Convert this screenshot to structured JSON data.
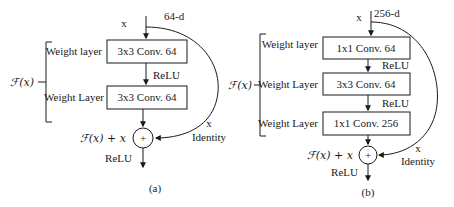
{
  "diagrams": [
    {
      "id": "a",
      "caption": "(a)",
      "input_label": "x",
      "dimension_label": "64-d",
      "function_label": "ℱ(x)",
      "layers": [
        {
          "side_label": "Weight layer",
          "box_label": "3x3 Conv. 64"
        },
        {
          "side_label": "Weight Layer",
          "box_label": "3x3 Conv. 64"
        }
      ],
      "between_activation": [
        "ReLU"
      ],
      "sum_label": "ℱ(x) + x",
      "skip_label_x": "x",
      "skip_label_identity": "Identity",
      "output_activation": "ReLU",
      "sum_symbol": "+"
    },
    {
      "id": "b",
      "caption": "(b)",
      "input_label": "x",
      "dimension_label": "256-d",
      "function_label": "ℱ(x)",
      "layers": [
        {
          "side_label": "Weight layer",
          "box_label": "1x1 Conv. 64"
        },
        {
          "side_label": "Weight Layer",
          "box_label": "3x3 Conv. 64"
        },
        {
          "side_label": "Weight Layer",
          "box_label": "1x1 Conv. 256"
        }
      ],
      "between_activation": [
        "ReLU",
        "ReLU"
      ],
      "sum_label": "ℱ(x) + x",
      "skip_label_x": "x",
      "skip_label_identity": "Identity",
      "output_activation": "ReLU",
      "sum_symbol": "+"
    }
  ],
  "colors": {
    "stroke": "#1a1a1a",
    "background": "#ffffff"
  }
}
